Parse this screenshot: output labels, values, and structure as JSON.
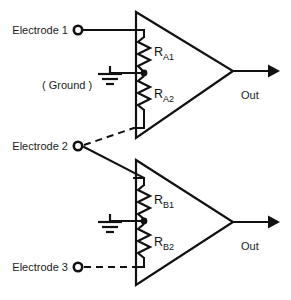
{
  "diagram": {
    "background_color": "#ffffff",
    "line_color": "#111111",
    "text_color": "#1c1c1c"
  },
  "labels": {
    "electrode1": "Electrode 1",
    "electrode2": "Electrode 2",
    "electrode3": "Electrode 3",
    "ground": "( Ground )",
    "out_top": "Out",
    "out_bottom": "Out"
  },
  "resistors": {
    "a1": {
      "base": "R",
      "sub": "A1"
    },
    "a2": {
      "base": "R",
      "sub": "A2"
    },
    "b1": {
      "base": "R",
      "sub": "B1"
    },
    "b2": {
      "base": "R",
      "sub": "B2"
    }
  },
  "amplifiers": [
    {
      "name": "amplifier-a",
      "output": "Out"
    },
    {
      "name": "amplifier-b",
      "output": "Out"
    }
  ],
  "connections": [
    {
      "from": "Electrode 1",
      "to": "amplifier-a top input",
      "style": "solid"
    },
    {
      "from": "Electrode 2",
      "to": "amplifier-a bottom input",
      "style": "dashed"
    },
    {
      "from": "Electrode 2",
      "to": "amplifier-b top input",
      "style": "solid"
    },
    {
      "from": "Electrode 3",
      "to": "amplifier-b bottom input",
      "style": "dashed"
    },
    {
      "from": "Ground",
      "to": "RA1/RA2 junction",
      "style": "solid"
    },
    {
      "from": "Ground",
      "to": "RB1/RB2 junction",
      "style": "solid"
    }
  ]
}
